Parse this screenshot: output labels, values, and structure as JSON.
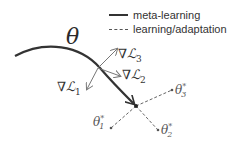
{
  "legend": {
    "items": [
      {
        "style": "solid",
        "label": "meta-learning"
      },
      {
        "style": "dashed",
        "label": "learning/adaptation"
      }
    ]
  },
  "labels": {
    "theta": "θ",
    "grad_symbol": "∇",
    "loss_symbol": "ℒ",
    "grad1_sub": "1",
    "grad2_sub": "2",
    "grad3_sub": "3",
    "theta_star": "θ",
    "star_sup": "*",
    "opt1_sub": "1",
    "opt2_sub": "2",
    "opt3_sub": "3"
  },
  "colors": {
    "meta_path": "#333333",
    "gradient_arrows": "#777777",
    "adaptation_dashed": "#666666",
    "text": "#333333"
  }
}
